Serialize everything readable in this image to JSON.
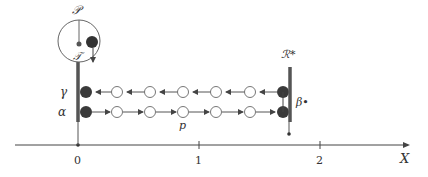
{
  "diagram": {
    "labels": {
      "P": "𝒫",
      "T": "𝒯",
      "R_star": "ℛ*",
      "gamma": "γ",
      "alpha": "α",
      "beta_star": "β•",
      "p": "p",
      "x_axis": "X"
    },
    "axis": {
      "ticks": [
        "0",
        "1",
        "2"
      ]
    },
    "rows": {
      "gamma": {
        "direction": "left",
        "open_circles": 5
      },
      "alpha": {
        "direction": "right",
        "open_circles": 5
      }
    },
    "colors": {
      "ink": "#333333",
      "bar": "#555555",
      "filled": "#444444",
      "open": "#777777"
    }
  }
}
